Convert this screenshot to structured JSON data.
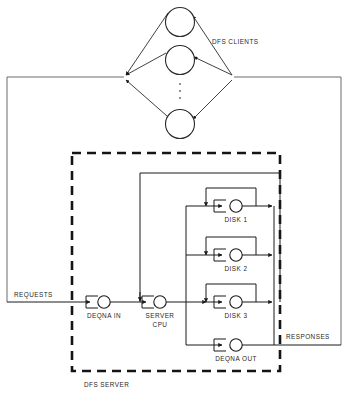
{
  "diagram": {
    "type": "queueing-network-diagram",
    "colors": {
      "line": "#1a1a1a",
      "frame": "#6b6b6b",
      "dashed_boundary": "#141414",
      "background": "#ffffff",
      "text": "#1f1f1f",
      "ellipsis": "#7a7a7a"
    },
    "labels": {
      "clients": "DFS CLIENTS",
      "requests": "REQUESTS",
      "responses": "RESPONSES",
      "server_boundary": "DFS SERVER"
    },
    "service_centers": [
      {
        "id": "deqna-in",
        "label": "DEQNA IN",
        "cx": 104,
        "cy": 302,
        "r": 6.2,
        "label_x": 104,
        "label_y": 316
      },
      {
        "id": "server-cpu",
        "label_line1": "SERVER",
        "label_line2": "CPU",
        "label": "SERVER CPU",
        "cx": 160,
        "cy": 302,
        "r": 6.2,
        "label_x": 160,
        "label_y": 316
      },
      {
        "id": "disk-1",
        "label": "DISK 1",
        "cx": 236,
        "cy": 206,
        "r": 6.2,
        "label_x": 236,
        "label_y": 220
      },
      {
        "id": "disk-2",
        "label": "DISK 2",
        "cx": 236,
        "cy": 255,
        "r": 6.2,
        "label_x": 236,
        "label_y": 269
      },
      {
        "id": "disk-3",
        "label": "DISK 3",
        "cx": 236,
        "cy": 302,
        "r": 6.2,
        "label_x": 236,
        "label_y": 316
      },
      {
        "id": "deqna-out",
        "label": "DEQNA OUT",
        "cx": 236,
        "cy": 345,
        "r": 6.2,
        "label_x": 236,
        "label_y": 359
      }
    ],
    "clients": [
      {
        "id": "client-1",
        "cx": 180,
        "cy": 22,
        "r": 14.5
      },
      {
        "id": "client-2",
        "cx": 180,
        "cy": 60,
        "r": 14.5
      },
      {
        "id": "client-3",
        "cx": 180,
        "cy": 124,
        "r": 14.5
      }
    ],
    "client_ellipsis": {
      "cx": 180,
      "dots_y": [
        84,
        91,
        98
      ],
      "r": 1.1
    },
    "fan_vertices": {
      "left_x": 124,
      "right_x": 234,
      "y": 77
    },
    "outer_frame": {
      "left_x": 7,
      "right_x": 341,
      "top_y": 77,
      "requests_y": 302,
      "responses_y": 345
    },
    "server_boundary_box": {
      "x": 72,
      "y": 153,
      "width": 208,
      "height": 218
    },
    "inner_box": {
      "x": 126,
      "y": 173,
      "width": 154,
      "height": 129
    },
    "disk_bus_box": {
      "x": 186,
      "y": 192,
      "width": 88,
      "height": 153
    },
    "label_positions": {
      "clients_x": 212,
      "clients_y": 42,
      "requests_x": 14,
      "requests_y": 295,
      "responses_x": 286,
      "responses_y": 337,
      "server_boundary_x": 84,
      "server_boundary_y": 385
    }
  }
}
